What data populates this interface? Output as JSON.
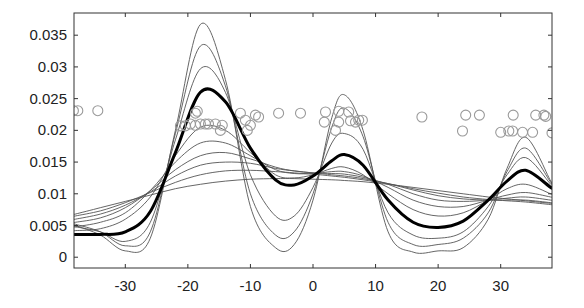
{
  "chart_data": {
    "type": "line",
    "title": "",
    "xlabel": "",
    "ylabel": "",
    "xlim": [
      -38.2,
      38.2
    ],
    "ylim": [
      -0.0017,
      0.0385
    ],
    "grid": false,
    "legend": null,
    "xticks": [
      -30,
      -20,
      -10,
      0,
      10,
      20,
      30
    ],
    "xtick_labels": [
      "-30",
      "-20",
      "-10",
      "0",
      "10",
      "20",
      "30"
    ],
    "yticks": [
      0,
      0.005,
      0.01,
      0.015,
      0.02,
      0.025,
      0.03,
      0.035
    ],
    "ytick_labels": [
      "0",
      "0.005",
      "0.01",
      "0.015",
      "0.02",
      "0.025",
      "0.03",
      "0.035"
    ],
    "x": [
      -38,
      -34,
      -30,
      -26,
      -22,
      -18,
      -14,
      -10,
      -6,
      -3,
      0,
      3,
      5,
      8,
      12,
      16,
      20,
      24,
      28,
      31,
      34,
      38
    ],
    "series": [
      {
        "name": "thin-1",
        "style": "thin",
        "values": [
          0.005,
          0.0035,
          0.001,
          0.003,
          0.02,
          0.0367,
          0.028,
          0.008,
          0.0015,
          0.002,
          0.009,
          0.022,
          0.0256,
          0.02,
          0.004,
          0.0008,
          0.001,
          0.0015,
          0.006,
          0.014,
          0.0189,
          0.012
        ]
      },
      {
        "name": "thin-2",
        "style": "thin",
        "values": [
          0.0052,
          0.004,
          0.0018,
          0.004,
          0.0195,
          0.0333,
          0.027,
          0.01,
          0.0035,
          0.004,
          0.01,
          0.0205,
          0.0235,
          0.019,
          0.0055,
          0.002,
          0.002,
          0.003,
          0.007,
          0.0135,
          0.0172,
          0.0118
        ]
      },
      {
        "name": "thin-3",
        "style": "thin",
        "values": [
          0.0048,
          0.004,
          0.0025,
          0.0055,
          0.0185,
          0.0297,
          0.026,
          0.013,
          0.0065,
          0.0065,
          0.011,
          0.018,
          0.0195,
          0.017,
          0.007,
          0.0035,
          0.003,
          0.004,
          0.008,
          0.013,
          0.0157,
          0.0115
        ]
      },
      {
        "name": "thin-4",
        "style": "thin",
        "values": [
          0.0042,
          0.0045,
          0.006,
          0.0095,
          0.016,
          0.0205,
          0.02,
          0.0165,
          0.013,
          0.0125,
          0.013,
          0.014,
          0.0142,
          0.013,
          0.01,
          0.0075,
          0.0065,
          0.007,
          0.009,
          0.0108,
          0.0115,
          0.01
        ]
      },
      {
        "name": "thin-5",
        "style": "thin",
        "values": [
          0.0048,
          0.0055,
          0.007,
          0.0105,
          0.015,
          0.018,
          0.018,
          0.016,
          0.0138,
          0.0132,
          0.0132,
          0.0135,
          0.0135,
          0.0128,
          0.011,
          0.009,
          0.008,
          0.008,
          0.009,
          0.0098,
          0.0102,
          0.0095
        ]
      },
      {
        "name": "thin-6",
        "style": "thin",
        "values": [
          0.0055,
          0.0062,
          0.0078,
          0.0105,
          0.0138,
          0.016,
          0.0165,
          0.0155,
          0.0142,
          0.0136,
          0.0133,
          0.0132,
          0.0131,
          0.0126,
          0.0115,
          0.01,
          0.009,
          0.0088,
          0.009,
          0.0093,
          0.0095,
          0.009
        ]
      },
      {
        "name": "thin-7",
        "style": "thin",
        "values": [
          0.006,
          0.0068,
          0.0082,
          0.0103,
          0.0128,
          0.0145,
          0.015,
          0.0148,
          0.014,
          0.0136,
          0.0133,
          0.013,
          0.0128,
          0.0124,
          0.0116,
          0.0106,
          0.0097,
          0.0092,
          0.009,
          0.009,
          0.009,
          0.0086
        ]
      },
      {
        "name": "thin-8",
        "style": "thin",
        "values": [
          0.0065,
          0.0073,
          0.0086,
          0.0102,
          0.0118,
          0.013,
          0.0136,
          0.0137,
          0.0135,
          0.0133,
          0.0131,
          0.0128,
          0.0126,
          0.0122,
          0.0116,
          0.0108,
          0.0101,
          0.0095,
          0.0091,
          0.0089,
          0.0087,
          0.0083
        ]
      },
      {
        "name": "thin-9",
        "style": "thin",
        "values": [
          0.0068,
          0.0078,
          0.0088,
          0.0098,
          0.0108,
          0.0115,
          0.012,
          0.0123,
          0.0124,
          0.0124,
          0.0123,
          0.0122,
          0.0121,
          0.0119,
          0.0115,
          0.011,
          0.0105,
          0.01,
          0.0095,
          0.0092,
          0.0089,
          0.0085
        ]
      },
      {
        "name": "thick-mean",
        "style": "thick",
        "values": [
          0.0036,
          0.0036,
          0.004,
          0.0072,
          0.0165,
          0.026,
          0.0245,
          0.0172,
          0.0122,
          0.0114,
          0.0128,
          0.0152,
          0.0162,
          0.0145,
          0.009,
          0.0055,
          0.0047,
          0.0057,
          0.009,
          0.012,
          0.0137,
          0.011
        ]
      }
    ],
    "scatter": {
      "name": "observations",
      "marker": "open-circle",
      "color": "#9a9a9a",
      "points": [
        [
          -38.3,
          0.0231
        ],
        [
          -37.6,
          0.0231
        ],
        [
          -34.4,
          0.0231
        ],
        [
          -18.8,
          0.0227
        ],
        [
          -18.5,
          0.023
        ],
        [
          -21.2,
          0.0207
        ],
        [
          -20.4,
          0.0207
        ],
        [
          -19.6,
          0.021
        ],
        [
          -18.8,
          0.0208
        ],
        [
          -18.0,
          0.021
        ],
        [
          -17.2,
          0.021
        ],
        [
          -16.7,
          0.021
        ],
        [
          -15.6,
          0.021
        ],
        [
          -14.5,
          0.0208
        ],
        [
          -14.8,
          0.02
        ],
        [
          -11.6,
          0.0227
        ],
        [
          -10.8,
          0.0216
        ],
        [
          -10.5,
          0.02
        ],
        [
          -10.0,
          0.0208
        ],
        [
          -9.2,
          0.0224
        ],
        [
          -8.7,
          0.0221
        ],
        [
          -5.5,
          0.0227
        ],
        [
          -2.0,
          0.0227
        ],
        [
          2.0,
          0.0229
        ],
        [
          1.8,
          0.0213
        ],
        [
          4.1,
          0.023
        ],
        [
          4.1,
          0.0213
        ],
        [
          5.7,
          0.0229
        ],
        [
          6.0,
          0.0215
        ],
        [
          6.8,
          0.0213
        ],
        [
          7.3,
          0.0216
        ],
        [
          7.9,
          0.0216
        ],
        [
          3.6,
          0.02
        ],
        [
          17.4,
          0.0221
        ],
        [
          24.4,
          0.0224
        ],
        [
          26.6,
          0.0224
        ],
        [
          32.0,
          0.0224
        ],
        [
          35.6,
          0.0224
        ],
        [
          36.9,
          0.0224
        ],
        [
          37.2,
          0.0222
        ],
        [
          23.9,
          0.0199
        ],
        [
          30.0,
          0.0197
        ],
        [
          31.3,
          0.0199
        ],
        [
          31.9,
          0.0199
        ],
        [
          33.5,
          0.0197
        ],
        [
          35.1,
          0.0197
        ],
        [
          38.2,
          0.0196
        ]
      ]
    },
    "colors": {
      "thin": "#555555",
      "thick": "#000000",
      "axis": "#333333",
      "marker": "#9a9a9a"
    }
  }
}
